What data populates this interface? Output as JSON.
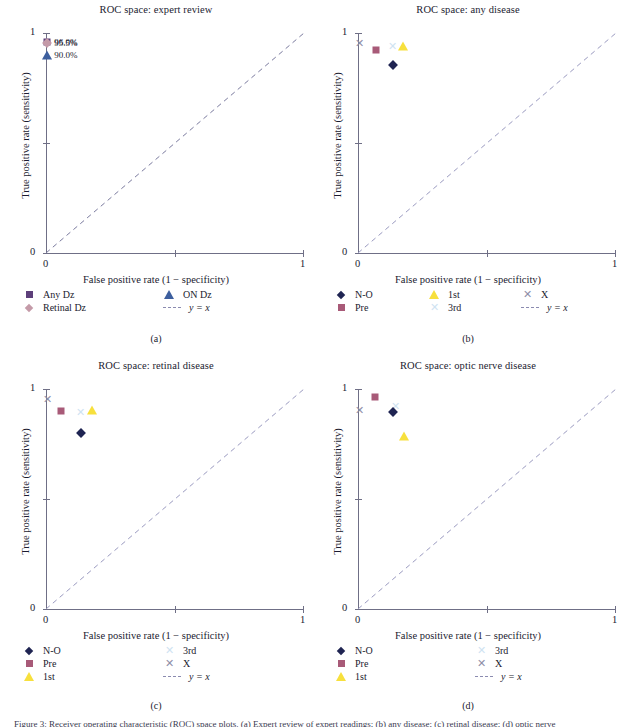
{
  "figure": {
    "caption_partial": "Figure 3: Receiver operating characteristic (ROC) space plots. (a) Expert review of expert readings; (b) any disease; (c) retinal disease; (d) optic nerve",
    "axis_titles": {
      "x": "False positive rate (1 − specificity)",
      "y": "True positive rate (sensitivity)"
    },
    "tick_labels": {
      "zero": "0",
      "one": "1"
    },
    "subplot_labels": {
      "a": "(a)",
      "b": "(b)",
      "c": "(c)",
      "d": "(d)"
    },
    "colors": {
      "navy": "#1f2452",
      "mauve": "#a85a78",
      "yellow": "#f7e03d",
      "paleblue": "#cfe3f2",
      "gray_x": "#8e8ea8",
      "purple_square": "#5d3f7a",
      "rose_diamond": "#c49aa8",
      "blue_triangle": "#3d5f9e",
      "diagonal": "#8b8bb0",
      "axis": "#6f6f86"
    }
  },
  "chart_data": [
    {
      "type": "scatter",
      "panel": "a",
      "title": "ROC space: expert review",
      "xlabel": "False positive rate (1 − specificity)",
      "ylabel": "True positive rate (sensitivity)",
      "xlim": [
        0,
        1
      ],
      "ylim": [
        0,
        1
      ],
      "grid": false,
      "legend_position": "below",
      "reference_line": {
        "label": "y = x",
        "style": "dashed",
        "from": [
          0,
          0
        ],
        "to": [
          1,
          1
        ]
      },
      "points": [
        {
          "series": "Any Dz",
          "marker": "square",
          "color": "#5d3f7a",
          "x": 0.005,
          "y": 0.96,
          "label": "96.0%"
        },
        {
          "series": "Retinal Dz",
          "marker": "diamond",
          "color": "#c49aa8",
          "x": 0.005,
          "y": 0.955,
          "label": "95.5%"
        },
        {
          "series": "ON Dz",
          "marker": "triangle",
          "color": "#3d5f9e",
          "x": 0.005,
          "y": 0.9,
          "label": "90.0%"
        }
      ],
      "legend": [
        {
          "label": "Any Dz",
          "marker": "square",
          "color": "#5d3f7a"
        },
        {
          "label": "ON Dz",
          "marker": "triangle",
          "color": "#3d5f9e"
        },
        {
          "label": "Retinal Dz",
          "marker": "diamond",
          "color": "#c49aa8"
        },
        {
          "label": "y = x",
          "marker": "dashed-line",
          "color": "#8b8bb0"
        }
      ]
    },
    {
      "type": "scatter",
      "panel": "b",
      "title": "ROC space: any disease",
      "xlabel": "False positive rate (1 − specificity)",
      "ylabel": "True positive rate (sensitivity)",
      "xlim": [
        0,
        1
      ],
      "ylim": [
        0,
        1
      ],
      "grid": false,
      "legend_position": "below",
      "reference_line": {
        "label": "y = x",
        "style": "dashed",
        "from": [
          0,
          0
        ],
        "to": [
          1,
          1
        ]
      },
      "points": [
        {
          "series": "X",
          "marker": "x",
          "color": "#8e8ea8",
          "x": 0.005,
          "y": 0.955
        },
        {
          "series": "Pre",
          "marker": "square",
          "color": "#a85a78",
          "x": 0.07,
          "y": 0.925
        },
        {
          "series": "3rd",
          "marker": "x",
          "color": "#cfe3f2",
          "x": 0.135,
          "y": 0.94
        },
        {
          "series": "1st",
          "marker": "triangle",
          "color": "#f7e03d",
          "x": 0.175,
          "y": 0.94
        },
        {
          "series": "N-O",
          "marker": "diamond",
          "color": "#1f2452",
          "x": 0.135,
          "y": 0.855
        }
      ],
      "legend": [
        {
          "label": "N-O",
          "marker": "diamond",
          "color": "#1f2452"
        },
        {
          "label": "1st",
          "marker": "triangle",
          "color": "#f7e03d"
        },
        {
          "label": "X",
          "marker": "x",
          "color": "#8e8ea8"
        },
        {
          "label": "Pre",
          "marker": "square",
          "color": "#a85a78"
        },
        {
          "label": "3rd",
          "marker": "x",
          "color": "#cfe3f2"
        },
        {
          "label": "y = x",
          "marker": "dashed-line",
          "color": "#8b8bb0"
        }
      ]
    },
    {
      "type": "scatter",
      "panel": "c",
      "title": "ROC space: retinal disease",
      "xlabel": "False positive rate (1 − specificity)",
      "ylabel": "True positive rate (sensitivity)",
      "xlim": [
        0,
        1
      ],
      "ylim": [
        0,
        1
      ],
      "grid": false,
      "legend_position": "below",
      "reference_line": {
        "label": "y = x",
        "style": "dashed",
        "from": [
          0,
          0
        ],
        "to": [
          1,
          1
        ]
      },
      "points": [
        {
          "series": "X",
          "marker": "x",
          "color": "#8e8ea8",
          "x": 0.005,
          "y": 0.955
        },
        {
          "series": "Pre",
          "marker": "square",
          "color": "#a85a78",
          "x": 0.06,
          "y": 0.9
        },
        {
          "series": "3rd",
          "marker": "x",
          "color": "#cfe3f2",
          "x": 0.135,
          "y": 0.895
        },
        {
          "series": "1st",
          "marker": "triangle",
          "color": "#f7e03d",
          "x": 0.18,
          "y": 0.905
        },
        {
          "series": "N-O",
          "marker": "diamond",
          "color": "#1f2452",
          "x": 0.135,
          "y": 0.8
        }
      ],
      "legend": [
        {
          "label": "N-O",
          "marker": "diamond",
          "color": "#1f2452"
        },
        {
          "label": "3rd",
          "marker": "x",
          "color": "#cfe3f2"
        },
        {
          "label": "Pre",
          "marker": "square",
          "color": "#a85a78"
        },
        {
          "label": "X",
          "marker": "x",
          "color": "#8e8ea8"
        },
        {
          "label": "1st",
          "marker": "triangle",
          "color": "#f7e03d"
        },
        {
          "label": "y = x",
          "marker": "dashed-line",
          "color": "#8b8bb0"
        }
      ]
    },
    {
      "type": "scatter",
      "panel": "d",
      "title": "ROC space: optic nerve disease",
      "xlabel": "False positive rate (1 − specificity)",
      "ylabel": "True positive rate (sensitivity)",
      "xlim": [
        0,
        1
      ],
      "ylim": [
        0,
        1
      ],
      "grid": false,
      "legend_position": "below",
      "reference_line": {
        "label": "y = x",
        "style": "dashed",
        "from": [
          0,
          0
        ],
        "to": [
          1,
          1
        ]
      },
      "points": [
        {
          "series": "Pre",
          "marker": "square",
          "color": "#a85a78",
          "x": 0.065,
          "y": 0.965
        },
        {
          "series": "X",
          "marker": "x",
          "color": "#8e8ea8",
          "x": 0.005,
          "y": 0.905
        },
        {
          "series": "3rd",
          "marker": "x",
          "color": "#cfe3f2",
          "x": 0.145,
          "y": 0.925
        },
        {
          "series": "N-O",
          "marker": "diamond",
          "color": "#1f2452",
          "x": 0.135,
          "y": 0.895
        },
        {
          "series": "1st",
          "marker": "triangle",
          "color": "#f7e03d",
          "x": 0.18,
          "y": 0.785
        }
      ],
      "legend": [
        {
          "label": "N-O",
          "marker": "diamond",
          "color": "#1f2452"
        },
        {
          "label": "3rd",
          "marker": "x",
          "color": "#cfe3f2"
        },
        {
          "label": "Pre",
          "marker": "square",
          "color": "#a85a78"
        },
        {
          "label": "X",
          "marker": "x",
          "color": "#8e8ea8"
        },
        {
          "label": "1st",
          "marker": "triangle",
          "color": "#f7e03d"
        },
        {
          "label": "y = x",
          "marker": "dashed-line",
          "color": "#8b8bb0"
        }
      ]
    }
  ]
}
